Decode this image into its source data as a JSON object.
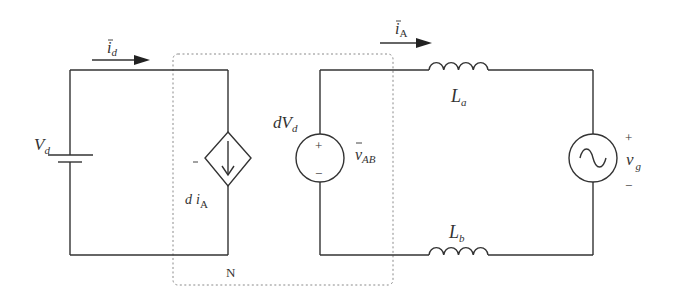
{
  "diagram": {
    "type": "circuit-schematic",
    "stroke_color": "#333333",
    "box_color": "#8a8a8a",
    "labels": {
      "dc_source": {
        "main": "V",
        "sub": "d"
      },
      "input_current": {
        "main": "i",
        "sub": "d",
        "overbar": true
      },
      "dependent_current": {
        "prefix": "d",
        "main": "i",
        "sub": "A",
        "overbar": true
      },
      "dependent_voltage": {
        "main": "dV",
        "sub": "d"
      },
      "output_voltage": {
        "main": "v",
        "sub": "AB",
        "overbar": true
      },
      "output_current": {
        "main": "i",
        "sub": "A",
        "overbar": true
      },
      "inductor_a": {
        "main": "L",
        "sub": "a"
      },
      "inductor_b": {
        "main": "L",
        "sub": "b"
      },
      "grid_source": {
        "main": "v",
        "sub": "g"
      },
      "network_box": "N",
      "plus": "+",
      "minus": "−"
    },
    "components": [
      {
        "id": "dc-source",
        "kind": "battery",
        "label": "Vd"
      },
      {
        "id": "dependent-current-source",
        "kind": "diamond-current-source",
        "label": "d iA"
      },
      {
        "id": "dependent-voltage-source",
        "kind": "voltage-source",
        "label": "dVd",
        "polarity": [
          "+",
          "−"
        ]
      },
      {
        "id": "inductor-a",
        "kind": "inductor",
        "label": "La"
      },
      {
        "id": "inductor-b",
        "kind": "inductor",
        "label": "Lb"
      },
      {
        "id": "ac-source",
        "kind": "ac-voltage-source",
        "label": "vg",
        "polarity": [
          "+",
          "−"
        ]
      },
      {
        "id": "network-N",
        "kind": "dashed-box",
        "label": "N"
      }
    ]
  }
}
